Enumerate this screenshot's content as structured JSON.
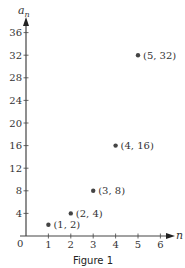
{
  "chart_data": {
    "type": "scatter",
    "title": "",
    "caption": "Figure 1",
    "xlabel": "n",
    "ylabel": "a",
    "ylabel_subscript": "n",
    "xlim": [
      0,
      6
    ],
    "ylim": [
      0,
      36
    ],
    "grid": false,
    "x_ticks": [
      1,
      2,
      3,
      4,
      5,
      6
    ],
    "x_tick_labels": [
      "1",
      "2",
      "3",
      "4",
      "5",
      "6"
    ],
    "y_ticks": [
      4,
      8,
      12,
      16,
      20,
      24,
      28,
      32,
      36
    ],
    "y_tick_labels": [
      "4",
      "8",
      "12",
      "16",
      "20",
      "24",
      "28",
      "32",
      "36"
    ],
    "origin_label": "0",
    "points": [
      {
        "x": 1,
        "y": 2,
        "label": "(1, 2)"
      },
      {
        "x": 2,
        "y": 4,
        "label": "(2, 4)"
      },
      {
        "x": 3,
        "y": 8,
        "label": "(3, 8)"
      },
      {
        "x": 4,
        "y": 16,
        "label": "(4, 16)"
      },
      {
        "x": 5,
        "y": 32,
        "label": "(5, 32)"
      }
    ],
    "colors": {
      "axis": "#444444",
      "point": "#444444",
      "text": "#333333"
    }
  }
}
